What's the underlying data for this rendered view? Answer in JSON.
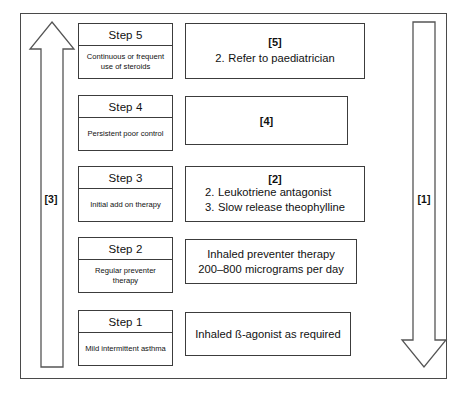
{
  "diagram": {
    "frame": {
      "name": "outer-frame"
    },
    "arrows": [
      {
        "id": "step-down-arrow",
        "label": "[1]",
        "direction": "down",
        "meaning": "step down treatment"
      },
      {
        "id": "step-up-arrow",
        "label": "[3]",
        "direction": "up",
        "meaning": "step up treatment"
      }
    ],
    "steps": [
      {
        "id": "step-5",
        "step_label": "Step 5",
        "description": "Continuous or frequent use of steroids",
        "treatment": {
          "tag": "[5]",
          "lines": [
            {
              "num": "2.",
              "text": "Refer to paediatrician"
            }
          ]
        }
      },
      {
        "id": "step-4",
        "step_label": "Step 4",
        "description": "Persistent poor control",
        "treatment": {
          "tag": "[4]",
          "lines": []
        }
      },
      {
        "id": "step-3",
        "step_label": "Step 3",
        "description": "Initial add on therapy",
        "treatment": {
          "tag": "[2]",
          "lines": [
            {
              "num": "2.",
              "text": "Leukotriene antagonist"
            },
            {
              "num": "3.",
              "text": "Slow release theophylline"
            }
          ]
        }
      },
      {
        "id": "step-2",
        "step_label": "Step 2",
        "description": "Regular preventer therapy",
        "treatment": {
          "tag": "",
          "lines": [],
          "centered_text_line1": "Inhaled preventer therapy",
          "centered_text_line2": "200–800 micrograms per day"
        }
      },
      {
        "id": "step-1",
        "step_label": "Step 1",
        "description": "Mild intermittent asthma",
        "treatment": {
          "tag": "",
          "lines": [],
          "centered_text_line1": "Inhaled ß-agonist as required",
          "centered_text_line2": ""
        }
      }
    ],
    "colors": {
      "frame_stroke": "#4a4a4a",
      "box_stroke": "#3c3c3c",
      "arrow_stroke": "#555555",
      "background": "#ffffff",
      "text": "#111111"
    }
  }
}
